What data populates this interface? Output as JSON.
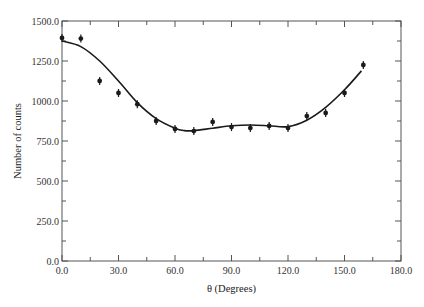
{
  "chart_data": {
    "type": "scatter",
    "title": "",
    "xlabel": "θ (Degrees)",
    "ylabel": "Number of counts",
    "xlim": [
      0,
      180
    ],
    "ylim": [
      0,
      1500
    ],
    "grid": false,
    "legend": null,
    "x_ticks": [
      0,
      30,
      60,
      90,
      120,
      150,
      180
    ],
    "x_tick_labels": [
      "0.0",
      "30.0",
      "60.0",
      "90.0",
      "120.0",
      "150.0",
      "180.0"
    ],
    "x_minor_step": 15,
    "y_ticks": [
      0,
      250,
      500,
      750,
      1000,
      1250,
      1500
    ],
    "y_tick_labels": [
      "0.0",
      "250.0",
      "500.0",
      "750.0",
      "1000.0",
      "1250.0",
      "1500.0"
    ],
    "y_minor_step": 125,
    "series": [
      {
        "name": "Measured counts",
        "style": "points-with-error-bars",
        "x": [
          0,
          10,
          20,
          30,
          40,
          50,
          60,
          70,
          80,
          90,
          100,
          110,
          120,
          130,
          140,
          150,
          160
        ],
        "y": [
          1394,
          1390,
          1125,
          1050,
          980,
          875,
          825,
          812,
          869,
          837,
          831,
          844,
          831,
          906,
          925,
          1050,
          1225
        ],
        "error": 25
      },
      {
        "name": "Fit curve",
        "style": "line",
        "x": [
          0,
          10,
          20,
          30,
          40,
          50,
          60,
          65,
          70,
          80,
          90,
          100,
          110,
          120,
          130,
          140,
          150,
          159
        ],
        "y": [
          1375,
          1340,
          1250,
          1125,
          990,
          890,
          830,
          815,
          815,
          830,
          845,
          850,
          845,
          840,
          880,
          960,
          1070,
          1188
        ]
      }
    ],
    "colors": {
      "axis": "#555555",
      "data": "#1a1a1a",
      "curve": "#1a1a1a"
    }
  }
}
